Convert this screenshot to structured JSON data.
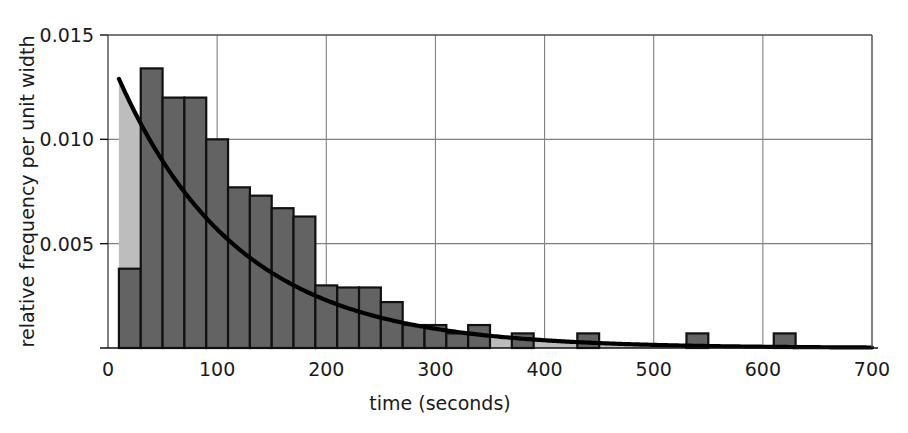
{
  "chart_data": {
    "type": "bar",
    "title": "",
    "subtitle": "",
    "xlabel": "time (seconds)",
    "ylabel": "relative frequency per unit width",
    "xlim": [
      0,
      700
    ],
    "ylim": [
      0,
      0.015
    ],
    "xticks": [
      0,
      100,
      200,
      300,
      400,
      500,
      600,
      700
    ],
    "xtick_labels": [
      "0",
      "100",
      "200",
      "300",
      "400",
      "500",
      "600",
      "700"
    ],
    "yticks": [
      0.005,
      0.01,
      0.015
    ],
    "ytick_labels": [
      "0.005",
      "0.010",
      "0.015"
    ],
    "grid": true,
    "grid_axis": "both",
    "legend": "none",
    "bin_width": 20,
    "bin_edges": [
      10,
      30,
      50,
      70,
      90,
      110,
      130,
      150,
      170,
      190,
      210,
      230,
      250,
      270,
      290,
      310,
      330,
      350,
      370,
      390,
      410,
      430,
      450,
      470,
      490,
      510,
      530,
      550,
      570,
      590,
      610,
      630
    ],
    "values": [
      0.0038,
      0.0134,
      0.012,
      0.012,
      0.01,
      0.0077,
      0.0073,
      0.0067,
      0.0063,
      0.003,
      0.0029,
      0.0029,
      0.0022,
      0.0011,
      0.0011,
      0.0007,
      0.0011,
      0.0,
      0.0007,
      0.0,
      0.0,
      0.0007,
      0.0,
      0.0,
      0.0,
      0.0,
      0.0007,
      0.0,
      0.0,
      0.0,
      0.0007
    ],
    "annotations": [
      {
        "name": "fitted-exponential-curve",
        "label": "exponential fit",
        "y0": 0.0129,
        "decay_rate": 0.0091
      }
    ],
    "series": [
      {
        "name": "histogram-observed",
        "type": "bar",
        "color": "#636363",
        "edge_color": "#111111"
      },
      {
        "name": "exponential-model-shading",
        "type": "area",
        "color": "#bdbdbd"
      },
      {
        "name": "fitted-exponential-curve",
        "type": "line",
        "color": "#000000",
        "line_width": 4
      }
    ]
  },
  "colors": {
    "bar_fill": "#636363",
    "bar_edge": "#111111",
    "shade_fill": "#bdbdbd",
    "curve": "#000000",
    "grid": "#808080",
    "frame": "#4d4d4d",
    "text": "#1a1a1a",
    "background": "#ffffff"
  },
  "axes": {
    "x_axis_name": "time-axis",
    "y_axis_name": "relative-frequency-axis"
  }
}
